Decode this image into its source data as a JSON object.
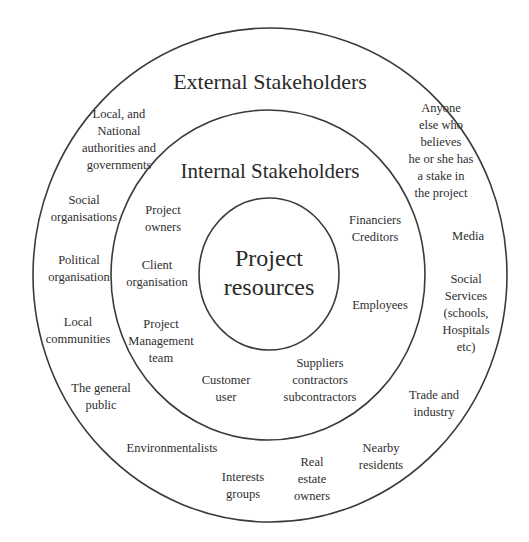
{
  "diagram": {
    "rings": {
      "outer": {
        "cx": 270,
        "cy": 275,
        "rx": 237,
        "ry": 247,
        "stroke": "#3a3a3a"
      },
      "middle": {
        "cx": 268,
        "cy": 275,
        "rx": 157,
        "ry": 165,
        "stroke": "#3a3a3a"
      },
      "inner": {
        "cx": 269,
        "cy": 274,
        "rx": 70,
        "ry": 76,
        "stroke": "#3a3a3a"
      }
    },
    "titles": {
      "external": "External Stakeholders",
      "internal": "Internal Stakeholders",
      "core": "Project\nresources"
    },
    "internal_stakeholders": [
      "Project\nowners",
      "Client\norganisation",
      "Project\nManagement\nteam",
      "Customer\nuser",
      "Suppliers\ncontractors\nsubcontractors",
      "Employees",
      "Financiers\nCreditors"
    ],
    "external_stakeholders": [
      "Local, and\nNational\nauthorities and\ngovernments",
      "Social\norganisations",
      "Political\norganisation",
      "Local\ncommunities",
      "The general\npublic",
      "Environmentalists",
      "Interests\ngroups",
      "Real\nestate\nowners",
      "Nearby\nresidents",
      "Trade and\nindustry",
      "Social\nServices\n(schools,\nHospitals\netc)",
      "Media",
      "Anyone\nelse who\nbelieves\nhe or she has\na stake in\nthe project"
    ]
  }
}
